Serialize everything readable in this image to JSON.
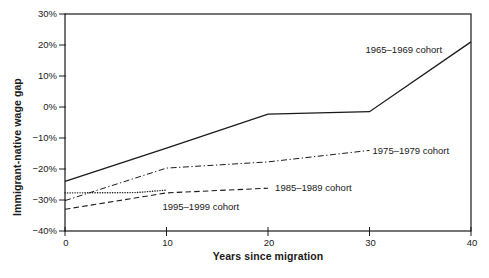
{
  "figure": {
    "background": "#ffffff",
    "line_color": "#1a1a1a",
    "text_color": "#1a1a1a"
  },
  "chart_data": {
    "type": "line",
    "title": "",
    "xlabel": "Years since migration",
    "ylabel": "Immigrant-native wage gap",
    "xlim": [
      0,
      40
    ],
    "ylim": [
      -40,
      30
    ],
    "grid": false,
    "legend_position": "inline-annotations",
    "x_ticks": [
      {
        "value": 0,
        "label": "0"
      },
      {
        "value": 10,
        "label": "10"
      },
      {
        "value": 20,
        "label": "20"
      },
      {
        "value": 30,
        "label": "30"
      },
      {
        "value": 40,
        "label": "40"
      }
    ],
    "y_ticks": [
      {
        "value": 30,
        "label": "30%"
      },
      {
        "value": 20,
        "label": "20%"
      },
      {
        "value": 10,
        "label": "10%"
      },
      {
        "value": 0,
        "label": "0%"
      },
      {
        "value": -10,
        "label": "−10%"
      },
      {
        "value": -20,
        "label": "−20%"
      },
      {
        "value": -30,
        "label": "−30%"
      },
      {
        "value": -40,
        "label": "−40%"
      }
    ],
    "series": [
      {
        "name": "1965–1969 cohort",
        "line_style": "solid",
        "points": [
          [
            0,
            -24
          ],
          [
            10,
            -13.3
          ],
          [
            20,
            -2.3
          ],
          [
            30,
            -1.5
          ],
          [
            40,
            21
          ]
        ]
      },
      {
        "name": "1975–1979 cohort",
        "line_style": "dash-dot",
        "points": [
          [
            0,
            -30.2
          ],
          [
            10,
            -19.7
          ],
          [
            20,
            -17.7
          ],
          [
            30,
            -14
          ]
        ]
      },
      {
        "name": "1985–1989 cohort",
        "line_style": "dashed",
        "points": [
          [
            0,
            -33
          ],
          [
            10,
            -27.7
          ],
          [
            20,
            -26.2
          ]
        ]
      },
      {
        "name": "1995–1999 cohort",
        "line_style": "dotted",
        "points": [
          [
            0,
            -27.7
          ],
          [
            7,
            -27.6
          ],
          [
            10,
            -26.8
          ]
        ]
      }
    ],
    "annotations": [
      {
        "text": "1965–1969 cohort",
        "x": 29.6,
        "y": 18.5,
        "anchor": "start"
      },
      {
        "text": "1975–1979 cohort",
        "x": 30.3,
        "y": -14.1,
        "anchor": "start"
      },
      {
        "text": "1985–1989 cohort",
        "x": 20.7,
        "y": -26.1,
        "anchor": "start"
      },
      {
        "text": "1995–1999 cohort",
        "x": 9.6,
        "y": -32.0,
        "anchor": "start"
      }
    ]
  }
}
